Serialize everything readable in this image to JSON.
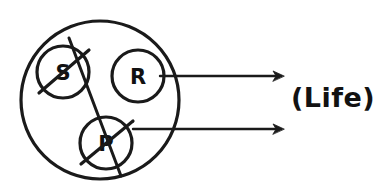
{
  "diagram": {
    "title": "",
    "background_color": "#ffffff",
    "ink_color": "#1a1a1a",
    "boundary": {
      "name": "system-boundary-circle",
      "shape": "circle",
      "cx": 100,
      "cy": 100,
      "r": 79,
      "stroke_width": 3.2
    },
    "nodes": [
      {
        "id": "s",
        "label": "S",
        "cx": 63,
        "cy": 72,
        "r": 26,
        "stroke_width": 3.2,
        "crossed_out": true,
        "slash": {
          "x1": 39,
          "y1": 93,
          "x2": 89,
          "y2": 50
        }
      },
      {
        "id": "p",
        "label": "P",
        "cx": 106,
        "cy": 143,
        "r": 26,
        "stroke_width": 3.2,
        "crossed_out": true,
        "slash": {
          "x1": 81,
          "y1": 164,
          "x2": 133,
          "y2": 121
        }
      },
      {
        "id": "r",
        "label": "R",
        "cx": 138,
        "cy": 76,
        "r": 26,
        "stroke_width": 3.2,
        "crossed_out": false,
        "slash": null
      }
    ],
    "connector": {
      "name": "s-p-crossing-line",
      "x1": 69,
      "y1": 38,
      "x2": 121,
      "y2": 176,
      "stroke_width": 3.0
    },
    "arrows": [
      {
        "id": "arrow-top",
        "x1": 160,
        "y1": 76,
        "x2": 284,
        "y2": 76,
        "stroke_width": 2.4,
        "head_size": 11
      },
      {
        "id": "arrow-bottom",
        "x1": 133,
        "y1": 129,
        "x2": 284,
        "y2": 129,
        "stroke_width": 2.4,
        "head_size": 11
      }
    ],
    "outcome": {
      "name": "outcome-label",
      "text": "(Life)",
      "x": 291,
      "y": 97
    }
  }
}
